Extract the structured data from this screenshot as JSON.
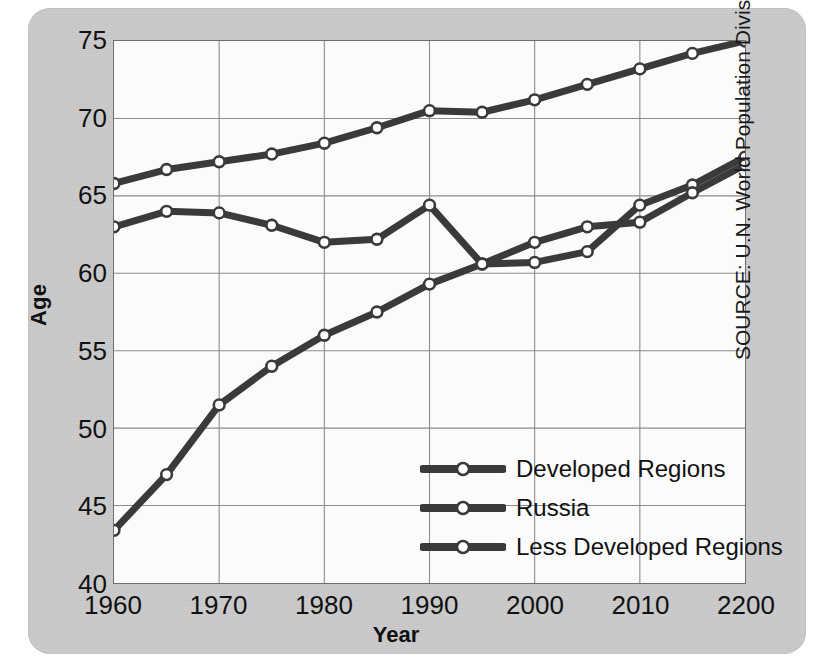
{
  "chart_data": {
    "type": "line",
    "title": "",
    "xlabel": "Year",
    "ylabel": "Age",
    "xlim": [
      1960,
      2020
    ],
    "ylim": [
      40,
      75
    ],
    "ytick_step": 5,
    "grid": true,
    "legend_position": "inside-lower-right",
    "x": [
      1960,
      1965,
      1970,
      1975,
      1980,
      1985,
      1990,
      1995,
      2000,
      2005,
      2010,
      2015,
      2020
    ],
    "xtick_values": [
      1960,
      1970,
      1980,
      1990,
      2000,
      2010,
      2020
    ],
    "xtick_labels": [
      "1960",
      "1970",
      "1980",
      "1990",
      "2000",
      "2010",
      "2200"
    ],
    "ytick_labels": [
      "40",
      "45",
      "50",
      "55",
      "60",
      "65",
      "70",
      "75"
    ],
    "ytick_values": [
      40,
      45,
      50,
      55,
      60,
      65,
      70,
      75
    ],
    "series": [
      {
        "name": "Developed Regions",
        "values": [
          65.8,
          66.7,
          67.2,
          67.7,
          68.4,
          69.4,
          70.5,
          70.4,
          71.2,
          72.2,
          73.2,
          74.2,
          75.0
        ]
      },
      {
        "name": "Russia",
        "values": [
          63.0,
          64.0,
          63.9,
          63.1,
          62.0,
          62.2,
          64.4,
          60.6,
          60.7,
          61.4,
          64.4,
          65.7,
          67.5
        ]
      },
      {
        "name": "Less Developed Regions",
        "values": [
          43.4,
          47.0,
          51.5,
          54.0,
          56.0,
          57.5,
          59.3,
          60.6,
          62.0,
          63.0,
          63.3,
          65.2,
          67.0
        ]
      }
    ],
    "source": "SOURCE: U.N. World Population Division"
  },
  "axes": {
    "x_axis_title": "Year",
    "y_axis_title": "Age"
  },
  "legend": {
    "items": [
      {
        "label": "Developed Regions"
      },
      {
        "label": "Russia"
      },
      {
        "label": "Less Developed Regions"
      }
    ]
  },
  "footer": {
    "source_text": "SOURCE: U.N. World Population Division"
  },
  "colors": {
    "line": "#3a3a3a",
    "marker_fill": "#ffffff",
    "grid": "#8d8d8d",
    "plot_background": "#fbfbfb",
    "card_background": "#c9c9c9",
    "page_background": "#ffffff",
    "text": "#111111"
  }
}
